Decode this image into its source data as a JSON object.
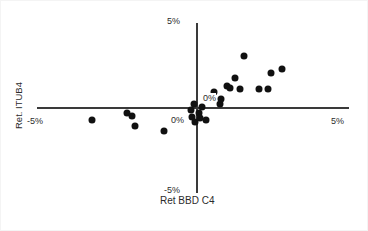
{
  "chart_data": {
    "type": "scatter",
    "title": "",
    "xlabel": "Ret BBD C4",
    "ylabel": "Ret. ITUB4",
    "xlim": [
      -5,
      5
    ],
    "ylim": [
      -5,
      5
    ],
    "grid": false,
    "legend": null,
    "xticks": [
      "-5%",
      "0%",
      "5%"
    ],
    "yticks": [
      "-5%",
      "0%",
      "5%"
    ],
    "axis_origin_labels": {
      "x_zero": "0%",
      "y_zero": "0%"
    },
    "marker": {
      "shape": "circle",
      "color": "#111111",
      "size_px": 7
    },
    "points": [
      {
        "x": -3.45,
        "y": -0.7
      },
      {
        "x": -2.3,
        "y": -0.3
      },
      {
        "x": -2.15,
        "y": -0.45
      },
      {
        "x": -2.05,
        "y": -1.05
      },
      {
        "x": -1.1,
        "y": -1.35
      },
      {
        "x": -0.55,
        "y": -0.65
      },
      {
        "x": -0.2,
        "y": -0.1
      },
      {
        "x": -0.15,
        "y": -0.55
      },
      {
        "x": -0.1,
        "y": 0.25
      },
      {
        "x": -0.05,
        "y": -0.85
      },
      {
        "x": 0.05,
        "y": -0.3
      },
      {
        "x": 0.1,
        "y": -0.6
      },
      {
        "x": 0.15,
        "y": 0.05
      },
      {
        "x": 0.3,
        "y": -0.7
      },
      {
        "x": 0.55,
        "y": 0.95
      },
      {
        "x": 0.75,
        "y": 0.25
      },
      {
        "x": 0.8,
        "y": 0.55
      },
      {
        "x": 1.0,
        "y": 1.3
      },
      {
        "x": 1.1,
        "y": 1.2
      },
      {
        "x": 1.25,
        "y": 1.75
      },
      {
        "x": 1.4,
        "y": 1.1
      },
      {
        "x": 1.55,
        "y": 3.05
      },
      {
        "x": 2.05,
        "y": 1.1
      },
      {
        "x": 2.35,
        "y": 1.1
      },
      {
        "x": 2.45,
        "y": 2.05
      },
      {
        "x": 2.8,
        "y": 2.3
      }
    ]
  },
  "labels": {
    "y_top": "5%",
    "y_bottom": "-5%",
    "x_left": "-5%",
    "x_right": "5%",
    "origin_y": "0%",
    "origin_x": "0%",
    "x_title": "Ret BBD C4",
    "y_title": "Ret. ITUB4"
  }
}
